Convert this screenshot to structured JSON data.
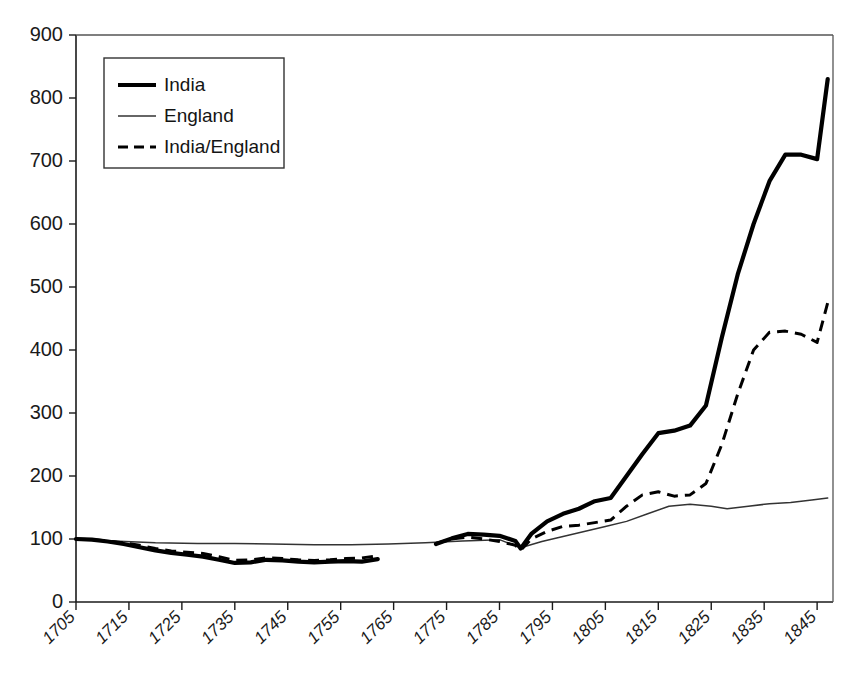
{
  "chart_data": {
    "type": "line",
    "title": "",
    "subtitle": "",
    "xlabel": "",
    "ylabel": "",
    "xlim": [
      1705,
      1848
    ],
    "ylim": [
      0,
      900
    ],
    "grid": false,
    "legend_position": "top-left",
    "y_ticks": [
      0,
      100,
      200,
      300,
      400,
      500,
      600,
      700,
      800,
      900
    ],
    "y_tick_labels": [
      "0",
      "100",
      "200",
      "300",
      "400",
      "500",
      "600",
      "700",
      "800",
      "900"
    ],
    "x_ticks": [
      1705,
      1715,
      1725,
      1735,
      1745,
      1755,
      1765,
      1775,
      1785,
      1795,
      1805,
      1815,
      1825,
      1835,
      1845
    ],
    "x_tick_labels": [
      "1705",
      "1715",
      "1725",
      "1735",
      "1745",
      "1755",
      "1765",
      "1775",
      "1785",
      "1795",
      "1805",
      "1815",
      "1825",
      "1835",
      "1845"
    ],
    "series": [
      {
        "name": "India",
        "style": "thick-solid",
        "color": "#000000",
        "segments": [
          {
            "x": [
              1705,
              1708,
              1711,
              1714,
              1717,
              1720,
              1723,
              1726,
              1729,
              1732,
              1735,
              1738,
              1741,
              1744,
              1747,
              1750,
              1753,
              1756,
              1759,
              1762
            ],
            "y": [
              100,
              99,
              96,
              92,
              87,
              82,
              78,
              75,
              72,
              67,
              62,
              63,
              67,
              66,
              64,
              63,
              64,
              65,
              64,
              68
            ]
          },
          {
            "x": [
              1773,
              1776,
              1779,
              1782,
              1785,
              1788,
              1789,
              1791,
              1794,
              1797,
              1800,
              1803,
              1806,
              1809,
              1812,
              1815,
              1818,
              1821,
              1824,
              1827,
              1830,
              1833,
              1836,
              1839,
              1842,
              1845,
              1847
            ],
            "y": [
              92,
              101,
              108,
              107,
              105,
              97,
              85,
              108,
              128,
              140,
              148,
              160,
              165,
              200,
              235,
              268,
              272,
              280,
              312,
              420,
              520,
              600,
              668,
              710,
              710,
              703,
              830
            ]
          }
        ]
      },
      {
        "name": "England",
        "style": "thin-solid",
        "color": "#333333",
        "segments": [
          {
            "x": [
              1705,
              1712,
              1720,
              1728,
              1735,
              1742,
              1750,
              1757,
              1764,
              1771,
              1778,
              1785,
              1789,
              1793,
              1797,
              1801,
              1805,
              1809,
              1813,
              1817,
              1821,
              1825,
              1828,
              1832,
              1836,
              1840,
              1844,
              1847
            ],
            "y": [
              100,
              97,
              94,
              93,
              93,
              92,
              91,
              91,
              92,
              94,
              97,
              99,
              86,
              96,
              104,
              112,
              120,
              128,
              140,
              152,
              155,
              152,
              148,
              152,
              156,
              158,
              162,
              165
            ]
          }
        ]
      },
      {
        "name": "India/England",
        "style": "dashed",
        "color": "#000000",
        "segments": [
          {
            "x": [
              1705,
              1708,
              1711,
              1714,
              1717,
              1720,
              1723,
              1726,
              1729,
              1732,
              1735,
              1738,
              1741,
              1744,
              1747,
              1750,
              1753,
              1756,
              1759,
              1762
            ],
            "y": [
              100,
              99,
              97,
              94,
              90,
              85,
              81,
              79,
              77,
              72,
              66,
              67,
              70,
              69,
              67,
              66,
              67,
              69,
              70,
              73
            ]
          },
          {
            "x": [
              1773,
              1776,
              1779,
              1782,
              1785,
              1788,
              1789,
              1791,
              1794,
              1797,
              1800,
              1803,
              1806,
              1809,
              1812,
              1815,
              1818,
              1821,
              1824,
              1827,
              1830,
              1833,
              1836,
              1839,
              1842,
              1845,
              1847
            ],
            "y": [
              93,
              100,
              103,
              100,
              96,
              90,
              82,
              100,
              112,
              120,
              122,
              126,
              130,
              152,
              170,
              175,
              168,
              170,
              188,
              250,
              330,
              400,
              428,
              430,
              425,
              412,
              475
            ]
          }
        ]
      }
    ],
    "legend": [
      {
        "label": "India",
        "style": "thick-solid"
      },
      {
        "label": "England",
        "style": "thin-solid"
      },
      {
        "label": "India/England",
        "style": "dashed"
      }
    ]
  }
}
